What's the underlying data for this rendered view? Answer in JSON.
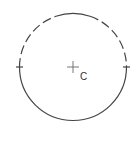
{
  "diagram": {
    "type": "circle",
    "center_label": "C",
    "colors": {
      "stroke": "#444444",
      "background": "#ffffff"
    },
    "center": {
      "x": 73,
      "y": 67
    },
    "radius": 54,
    "segments": [
      {
        "style": "dashed",
        "description": "upper-left arc"
      },
      {
        "style": "solid",
        "description": "top arc"
      },
      {
        "style": "dashed",
        "description": "upper-right arc"
      },
      {
        "style": "solid",
        "description": "lower arc"
      }
    ],
    "ticks": [
      "left",
      "right"
    ]
  }
}
